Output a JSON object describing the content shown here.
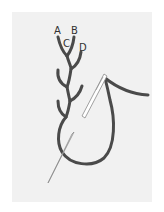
{
  "diagram": {
    "type": "embroidery-stitch-illustration",
    "labels": [
      {
        "id": "A",
        "text": "A",
        "x": 54,
        "y": 26
      },
      {
        "id": "B",
        "text": "B",
        "x": 71,
        "y": 26
      },
      {
        "id": "C",
        "text": "C",
        "x": 63,
        "y": 39
      },
      {
        "id": "D",
        "text": "D",
        "x": 79,
        "y": 43
      }
    ],
    "colors": {
      "background": "#ffffff",
      "panel": "#f1f1f1",
      "thread": "#4a4a4a",
      "needle": "#9a9a9a",
      "label": "#333333"
    }
  }
}
